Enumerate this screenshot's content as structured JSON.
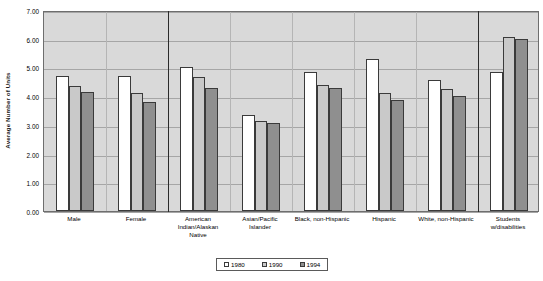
{
  "chart_data": {
    "type": "bar",
    "title": "",
    "xlabel": "",
    "ylabel": "Average Number of Units",
    "ylim": [
      0,
      7
    ],
    "ytick_step": 1,
    "ytick_labels": [
      "0.00",
      "1.00",
      "2.00",
      "3.00",
      "4.00",
      "5.00",
      "6.00",
      "7.00"
    ],
    "grid": true,
    "legend_position": "bottom-center",
    "categories": [
      "Male",
      "Female",
      "American Indian/Alaskan Native",
      "Asian/Pacific Islander",
      "Black, non-Hispanic",
      "Hispanic",
      "White, non-Hispanic",
      "Students w/disabilities"
    ],
    "category_lines": [
      [
        "Male"
      ],
      [
        "Female"
      ],
      [
        "American",
        "Indian/Alaskan",
        "Native"
      ],
      [
        "Asian/Pacific",
        "Islander"
      ],
      [
        "Black, non-Hispanic"
      ],
      [
        "Hispanic"
      ],
      [
        "White, non-Hispanic"
      ],
      [
        "Students",
        "w/disabilities"
      ]
    ],
    "series": [
      {
        "name": "1980",
        "color": "#ffffff",
        "values": [
          4.7,
          4.7,
          5.0,
          3.35,
          4.85,
          5.3,
          4.55,
          4.85
        ]
      },
      {
        "name": "1990",
        "color": "#c9c9c9",
        "values": [
          4.35,
          4.1,
          4.65,
          3.15,
          4.4,
          4.1,
          4.25,
          6.05
        ]
      },
      {
        "name": "1994",
        "color": "#8f8f8f",
        "values": [
          4.15,
          3.8,
          4.3,
          3.05,
          4.3,
          3.85,
          4.0,
          6.0
        ]
      }
    ],
    "section_dividers_after": [
      1,
      6
    ],
    "plot_background": "#d9d9d9",
    "gridline_color": "#a6a6a6"
  },
  "legend": {
    "items": [
      {
        "label": "1980"
      },
      {
        "label": "1990"
      },
      {
        "label": "1994"
      }
    ]
  }
}
